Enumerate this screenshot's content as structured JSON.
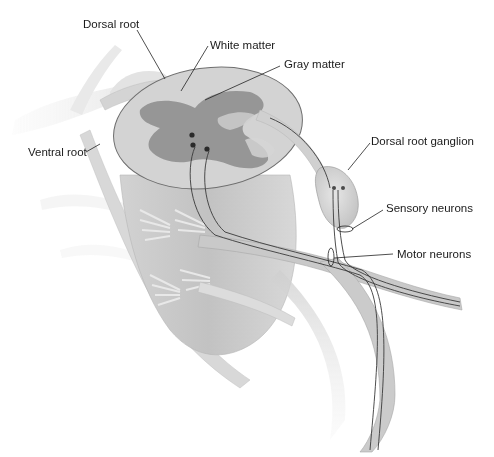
{
  "diagram": {
    "colors": {
      "background": "#ffffff",
      "tissue_light": "#d9d9d9",
      "tissue_mid": "#c4c4c4",
      "gray_matter": "#8f8f8f",
      "outline": "#6e6e6e",
      "neuron_line": "#3a3a3a",
      "label_text": "#1a1a1a",
      "leader_line": "#222222"
    },
    "labels": [
      {
        "id": "dorsal-root",
        "text": "Dorsal root",
        "x": 83,
        "y": 25,
        "leader": [
          [
            137,
            30
          ],
          [
            165,
            79
          ]
        ]
      },
      {
        "id": "white-matter",
        "text": "White matter",
        "x": 210,
        "y": 39,
        "leader": [
          [
            208,
            46
          ],
          [
            181,
            91
          ]
        ]
      },
      {
        "id": "gray-matter",
        "text": "Gray matter",
        "x": 284,
        "y": 58,
        "leader": [
          [
            280,
            66
          ],
          [
            205,
            100
          ]
        ]
      },
      {
        "id": "ventral-root",
        "text": "Ventral root",
        "x": 28,
        "y": 149,
        "leader": [
          [
            86,
            152
          ],
          [
            100,
            144
          ]
        ]
      },
      {
        "id": "dorsal-root-ganglion",
        "text": "Dorsal root ganglion",
        "x": 372,
        "y": 136,
        "leader": [
          [
            370,
            143
          ],
          [
            348,
            170
          ]
        ]
      },
      {
        "id": "sensory-neurons",
        "text": "Sensory neurons",
        "x": 386,
        "y": 202,
        "leader": [
          [
            383,
            210
          ],
          [
            352,
            229
          ]
        ]
      },
      {
        "id": "motor-neurons",
        "text": "Motor neurons",
        "x": 397,
        "y": 250,
        "leader": [
          [
            393,
            254
          ],
          [
            334,
            258
          ]
        ]
      }
    ]
  }
}
